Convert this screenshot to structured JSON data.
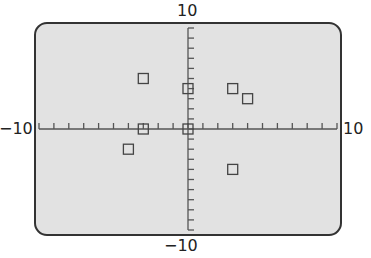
{
  "chart_data": {
    "type": "scatter",
    "title": "",
    "xlabel": "",
    "ylabel": "",
    "xlim": [
      -10,
      10
    ],
    "ylim": [
      -10,
      10
    ],
    "xscale_tick": 1,
    "yscale_tick": 1,
    "grid": false,
    "marker": "square",
    "points": [
      {
        "x": -3,
        "y": 5
      },
      {
        "x": 0,
        "y": 4
      },
      {
        "x": 3,
        "y": 4
      },
      {
        "x": 4,
        "y": 3
      },
      {
        "x": -3,
        "y": 0
      },
      {
        "x": 0,
        "y": 0
      },
      {
        "x": -4,
        "y": -2
      },
      {
        "x": 3,
        "y": -4
      }
    ]
  },
  "labels": {
    "ymax": "10",
    "ymin": "−10",
    "xmin": "−10",
    "xmax": "10"
  },
  "colors": {
    "screen_bg": "#e2e2e2",
    "frame": "#333333",
    "axis": "#555555",
    "marker": "#444444"
  }
}
